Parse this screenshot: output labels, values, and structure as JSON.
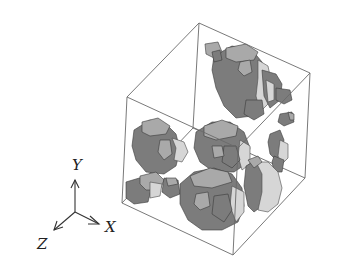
{
  "figure": {
    "colors": {
      "background": "#ffffff",
      "cube_edge": "#6a6a6a",
      "voxel_dark": "#7c7c7c",
      "voxel_mid": "#a9a9a9",
      "voxel_light": "#d6d6d6",
      "axis": "#333333"
    }
  },
  "axes": {
    "x_label": "X",
    "y_label": "Y",
    "z_label": "Z"
  },
  "cube": {
    "corners": {
      "top_back": [
        199,
        23
      ],
      "top_left": [
        127,
        97
      ],
      "top_right": [
        310,
        73
      ],
      "top_front": [
        238,
        148
      ],
      "bottom_back": [
        193,
        128
      ],
      "bottom_left": [
        122,
        203
      ],
      "bottom_right": [
        305,
        178
      ],
      "bottom_front": [
        233,
        255
      ]
    }
  },
  "clusters": [
    {
      "name": "upper-right-cluster",
      "center": [
        250,
        85
      ]
    },
    {
      "name": "left-cluster",
      "center": [
        160,
        155
      ]
    },
    {
      "name": "center-cluster",
      "center": [
        220,
        150
      ]
    },
    {
      "name": "lower-center-cluster",
      "center": [
        210,
        200
      ]
    },
    {
      "name": "right-disc-cluster",
      "center": [
        262,
        190
      ]
    },
    {
      "name": "small-right-fragments",
      "center": [
        280,
        140
      ]
    }
  ]
}
